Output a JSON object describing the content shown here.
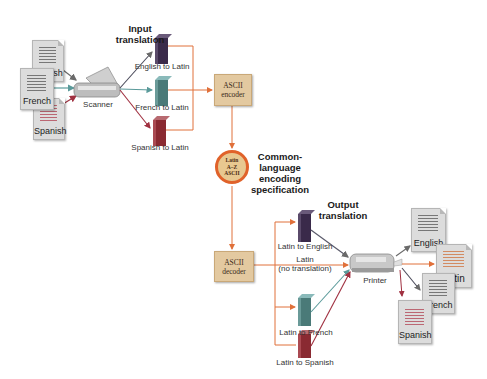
{
  "colors": {
    "orange_line": "#e0703a",
    "gray_arrow": "#7a7a7a",
    "red_arrow": "#a03040",
    "teal_arrow": "#5a9a9a",
    "box_fill": "#e3c9a0",
    "circle_border": "#e0622a",
    "english_book": "#3a2a4a",
    "french_book": "#4a7a78",
    "spanish_book": "#8a2a32"
  },
  "input": {
    "heading": "Input translation",
    "heading_lines": [
      "Input",
      "translation"
    ],
    "documents": [
      {
        "label": "English",
        "line_color": "#555555"
      },
      {
        "label": "French",
        "line_color": "#555555"
      },
      {
        "label": "Spanish",
        "line_color": "#b04050"
      }
    ],
    "scanner_label": "Scanner",
    "dictionaries": [
      {
        "label": "English to Latin",
        "color": "#3a2a4a"
      },
      {
        "label": "French to Latin",
        "color": "#4a7a78"
      },
      {
        "label": "Spanish to Latin",
        "color": "#8a2a32"
      }
    ],
    "encoder_lines": [
      "ASCII",
      "encoder"
    ]
  },
  "spec": {
    "circle_lines": [
      "Latin",
      "A–Z",
      "ASCII"
    ],
    "caption_lines": [
      "Common-",
      "language",
      "encoding",
      "specification"
    ]
  },
  "output": {
    "heading_lines": [
      "Output",
      "translation"
    ],
    "decoder_lines": [
      "ASCII",
      "decoder"
    ],
    "dictionaries": [
      {
        "label": "Latin to English",
        "color": "#3a2a4a"
      },
      {
        "label": "Latin to French",
        "color": "#4a7a78"
      },
      {
        "label": "Latin to Spanish",
        "color": "#8a2a32"
      }
    ],
    "passthrough_lines": [
      "Latin",
      "(no translation)"
    ],
    "printer_label": "Printer",
    "documents": [
      {
        "label": "English",
        "line_color": "#555555"
      },
      {
        "label": "Latin",
        "line_color": "#d0703a"
      },
      {
        "label": "French",
        "line_color": "#555555"
      },
      {
        "label": "Spanish",
        "line_color": "#b04050"
      }
    ]
  }
}
